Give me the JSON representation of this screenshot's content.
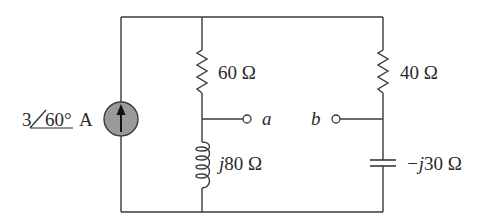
{
  "circuit": {
    "source": {
      "type": "current-source",
      "magnitude": "3",
      "angle": "60°",
      "unit": "A",
      "direction": "up",
      "fill_color": "#9a9a9a"
    },
    "middle_branch": {
      "resistor": {
        "value": "60 Ω"
      },
      "inductor": {
        "prefix": "j",
        "value": "80 Ω"
      }
    },
    "right_branch": {
      "resistor": {
        "value": "40 Ω"
      },
      "capacitor": {
        "prefix": "−j",
        "value": "30 Ω"
      }
    },
    "terminals": {
      "a": "a",
      "b": "b"
    }
  }
}
